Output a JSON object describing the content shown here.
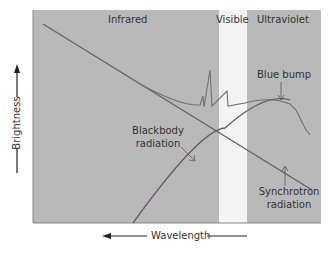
{
  "diagram": {
    "regions": {
      "infrared": "Infrared",
      "visible": "Visible",
      "ultraviolet": "Ultraviolet"
    },
    "labels": {
      "blue_bump": "Blue bump",
      "blackbody_1": "Blackbody",
      "blackbody_2": "radiation",
      "synchrotron_1": "Synchrotron",
      "synchrotron_2": "radiation"
    },
    "axes": {
      "y": "Brightness",
      "x": "Wavelength"
    },
    "colors": {
      "plot_bg": "#b8b8b8",
      "visible_band": "#f4f4f4",
      "curve": "#6a5a6a"
    }
  }
}
